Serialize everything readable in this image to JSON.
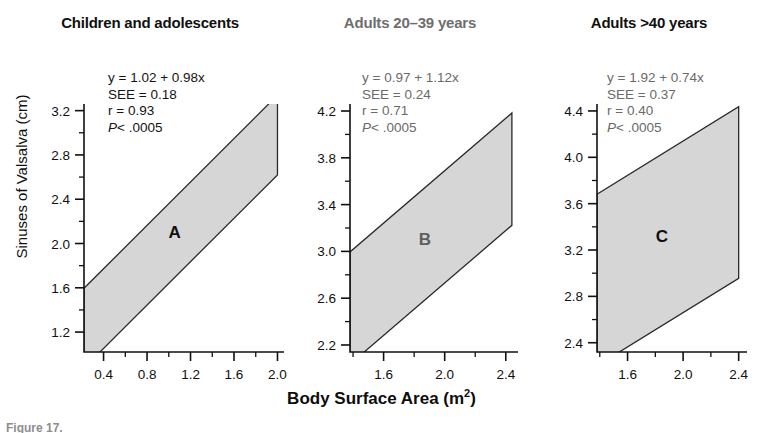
{
  "figure": {
    "y_axis_title": "Sinuses of Valsalva (cm)",
    "x_axis_title_main": "Body Surface Area (m",
    "x_axis_title_sup": "2",
    "x_axis_title_close": ")",
    "caption": "Figure 17."
  },
  "colors": {
    "band_fill": "#d6d6d6",
    "band_stroke": "#2a2a2a",
    "axis": "#111111",
    "text_dark": "#101010",
    "text_muted": "#6a6a6a"
  },
  "chart_data": [
    {
      "type": "line",
      "panel": "A",
      "title": "Children and adolescents",
      "title_muted": false,
      "stats_muted": false,
      "equation": "y = 1.02 + 0.98x",
      "intercept": 1.02,
      "slope": 0.98,
      "see_label": "SEE = 0.18",
      "see": 0.18,
      "r_label": "r = 0.93",
      "r": 0.93,
      "p_prefix": "P",
      "p_label": "< .0005",
      "band_letter": "A",
      "band_letter_muted": false,
      "xlabel": "Body Surface Area (m2)",
      "ylabel": "Sinuses of Valsalva (cm)",
      "xlim": [
        0.22,
        2.06
      ],
      "ylim": [
        1.02,
        3.26
      ],
      "xticks": [
        0.4,
        0.8,
        1.2,
        1.6,
        2.0
      ],
      "xtick_labels": [
        "0.4",
        "0.8",
        "1.2",
        "1.6",
        "2.0"
      ],
      "yticks": [
        1.2,
        1.6,
        2.0,
        2.4,
        2.8,
        3.2
      ],
      "ytick_labels": [
        "1.2",
        "1.6",
        "2.0",
        "2.4",
        "2.8",
        "3.2"
      ],
      "minor_tick_step_x": 0.2,
      "minor_tick_step_y": 0.2,
      "grid": false,
      "band_upper_offset": 0.36,
      "band_lower_offset": -0.36,
      "band_x_start": 0.22,
      "band_x_end": 2.0
    },
    {
      "type": "line",
      "panel": "B",
      "title": "Adults 20–39 years",
      "title_muted": true,
      "stats_muted": true,
      "equation": "y = 0.97 + 1.12x",
      "intercept": 0.97,
      "slope": 1.12,
      "see_label": "SEE = 0.24",
      "see": 0.24,
      "r_label": "r = 0.71",
      "r": 0.71,
      "p_prefix": "P",
      "p_label": "< .0005",
      "band_letter": "B",
      "band_letter_muted": true,
      "xlabel": "Body Surface Area (m2)",
      "ylabel": "Sinuses of Valsalva (cm)",
      "xlim": [
        1.38,
        2.48
      ],
      "ylim": [
        2.14,
        4.26
      ],
      "xticks": [
        1.6,
        2.0,
        2.4
      ],
      "xtick_labels": [
        "1.6",
        "2.0",
        "2.4"
      ],
      "yticks": [
        2.2,
        2.6,
        3.0,
        3.4,
        3.8,
        4.2
      ],
      "ytick_labels": [
        "2.2",
        "2.6",
        "3.0",
        "3.4",
        "3.8",
        "4.2"
      ],
      "minor_tick_step_x": 0.2,
      "minor_tick_step_y": 0.2,
      "grid": false,
      "band_upper_offset": 0.48,
      "band_lower_offset": -0.48,
      "band_x_start": 1.38,
      "band_x_end": 2.44
    },
    {
      "type": "line",
      "panel": "C",
      "title": "Adults >40 years",
      "title_muted": false,
      "stats_muted": true,
      "equation": "y = 1.92 + 0.74x",
      "intercept": 1.92,
      "slope": 0.74,
      "see_label": "SEE = 0.37",
      "see": 0.37,
      "r_label": "r = 0.40",
      "r": 0.4,
      "p_prefix": "P",
      "p_label": "< .0005",
      "band_letter": "C",
      "band_letter_muted": false,
      "xlabel": "Body Surface Area (m2)",
      "ylabel": "Sinuses of Valsalva (cm)",
      "xlim": [
        1.38,
        2.46
      ],
      "ylim": [
        2.32,
        4.46
      ],
      "xticks": [
        1.6,
        2.0,
        2.4
      ],
      "xtick_labels": [
        "1.6",
        "2.0",
        "2.4"
      ],
      "yticks": [
        2.4,
        2.8,
        3.2,
        3.6,
        4.0,
        4.4
      ],
      "ytick_labels": [
        "2.4",
        "2.8",
        "3.2",
        "3.6",
        "4.0",
        "4.4"
      ],
      "minor_tick_step_x": 0.2,
      "minor_tick_step_y": 0.2,
      "grid": false,
      "band_upper_offset": 0.74,
      "band_lower_offset": -0.74,
      "band_x_start": 1.38,
      "band_x_end": 2.4
    }
  ]
}
